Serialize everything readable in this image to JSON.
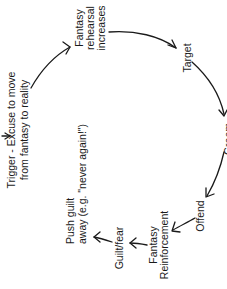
{
  "diagram": {
    "orientation": "rotated -90 degrees (text reads bottom-to-top)",
    "nodes": [
      {
        "id": "trigger",
        "lines": [
          "Trigger - Excuse to move",
          "from fantasy to reality"
        ]
      },
      {
        "id": "fantasy_rehearsal",
        "lines": [
          "Fantasy",
          "rehearsal",
          "increases"
        ]
      },
      {
        "id": "target",
        "lines": [
          "Target"
        ]
      },
      {
        "id": "groom",
        "lines": [
          "Groom"
        ]
      },
      {
        "id": "offend",
        "lines": [
          "Offend"
        ]
      },
      {
        "id": "fantasy_reinforcement",
        "lines": [
          "Fantasy",
          "Reinforcement"
        ]
      },
      {
        "id": "guilt_fear",
        "lines": [
          "Guilt/fear"
        ]
      },
      {
        "id": "push_guilt",
        "lines": [
          "Push guilt",
          "away (e.g. \"never again!\")"
        ]
      }
    ],
    "edges": [
      {
        "from": "trigger",
        "to": "fantasy_rehearsal"
      },
      {
        "from": "fantasy_rehearsal",
        "to": "target"
      },
      {
        "from": "target",
        "to": "groom"
      },
      {
        "from": "groom",
        "to": "offend"
      },
      {
        "from": "offend",
        "to": "fantasy_reinforcement"
      },
      {
        "from": "fantasy_reinforcement",
        "to": "guilt_fear"
      },
      {
        "from": "guilt_fear",
        "to": "push_guilt"
      },
      {
        "from": "push_guilt",
        "to": "trigger"
      }
    ]
  }
}
